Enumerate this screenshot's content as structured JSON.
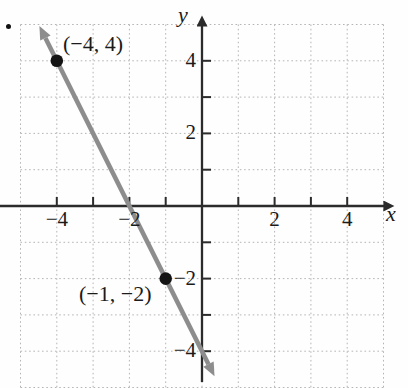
{
  "chart_data": {
    "type": "line",
    "title": "",
    "xlabel": "x",
    "ylabel": "y",
    "xlim": [
      -5,
      5
    ],
    "ylim": [
      -5,
      5
    ],
    "grid": true,
    "grid_step": 1,
    "tick_positions": [
      -4,
      -3,
      -2,
      -1,
      1,
      2,
      3,
      4
    ],
    "x_tick_labels": [
      {
        "value": -4,
        "label": "−4"
      },
      {
        "value": -2,
        "label": "−2"
      },
      {
        "value": 2,
        "label": "2"
      },
      {
        "value": 4,
        "label": "4"
      }
    ],
    "y_tick_labels": [
      {
        "value": 4,
        "label": "4"
      },
      {
        "value": 2,
        "label": "2"
      },
      {
        "value": -2,
        "label": "−2"
      },
      {
        "value": -4,
        "label": "−4"
      }
    ],
    "points": [
      {
        "x": -4,
        "y": 4,
        "label": "(−4, 4)"
      },
      {
        "x": -1,
        "y": -2,
        "label": "(−1, −2)"
      }
    ],
    "line": {
      "slope": -2,
      "y_intercept": -4,
      "x_drawn_range": [
        -4.48,
        0.345
      ],
      "arrows_both_ends": true
    },
    "colors": {
      "line": "#8d8d8d",
      "axis": "#2b2b2b",
      "grid": "#b5b5b5",
      "point": "#141414",
      "text": "#1b1b1b"
    }
  }
}
